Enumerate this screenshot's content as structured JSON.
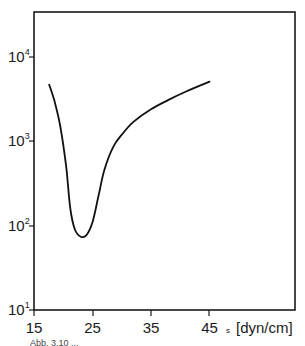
{
  "chart_data": {
    "type": "line",
    "title": "",
    "xlabel": "s [dyn/cm]",
    "ylabel": "",
    "x_ticks": [
      15,
      25,
      35,
      45
    ],
    "x_tick_labels": [
      "15",
      "25",
      "35",
      "45"
    ],
    "y_scale": "log",
    "y_ticks": [
      10,
      100,
      1000,
      10000
    ],
    "y_tick_labels": [
      {
        "base": "10",
        "exp": "1"
      },
      {
        "base": "10",
        "exp": "2"
      },
      {
        "base": "10",
        "exp": "3"
      },
      {
        "base": "10",
        "exp": "4"
      }
    ],
    "xlim": [
      15,
      59
    ],
    "ylim": [
      10,
      40000
    ],
    "grid": false,
    "legend": null,
    "series": [
      {
        "name": "curve",
        "x": [
          17.6,
          18.5,
          19.5,
          20.5,
          21.2,
          22.0,
          23.0,
          24.0,
          25.0,
          26.0,
          27.0,
          28.5,
          30.0,
          32.0,
          35.0,
          38.0,
          41.0,
          45.0
        ],
        "y": [
          4700,
          3000,
          1500,
          500,
          160,
          90,
          74,
          78,
          110,
          220,
          450,
          850,
          1200,
          1700,
          2400,
          3100,
          3900,
          5100
        ]
      }
    ]
  },
  "axis": {
    "x_unit_label": "s [dyn/cm]",
    "x_subscript_mark": "s"
  },
  "caption_fragment": "Abb. 3.10 ..."
}
